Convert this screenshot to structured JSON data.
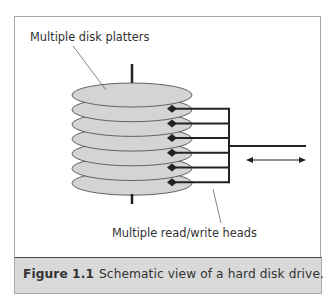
{
  "figure": {
    "number_label": "Figure 1.1",
    "caption_text": "Schematic view of a hard disk drive."
  },
  "labels": {
    "platters": "Multiple disk platters",
    "heads": "Multiple read/write heads"
  },
  "diagram": {
    "platter_count": 7,
    "head_count": 6,
    "colors": {
      "platter_fill": "#d4d4d4",
      "platter_stroke": "#555555",
      "arm": "#222222",
      "leader": "#666666",
      "caption_bar": "#d9d9d9"
    }
  }
}
